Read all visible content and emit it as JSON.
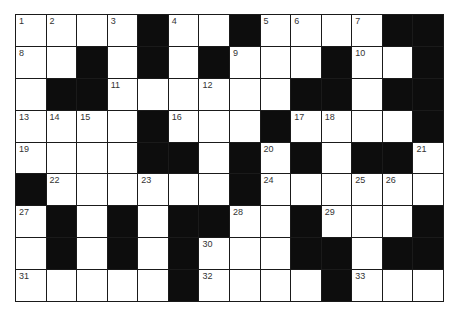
{
  "puzzle": {
    "type": "crossword",
    "rows": 9,
    "cols": 14,
    "colors": {
      "white": "#ffffff",
      "black": "#0d0d0d",
      "grid_line": "#1a1a1a",
      "number": "#333333"
    },
    "legend": "W = white cell, B = black cell, numbers = clue numbers",
    "grid": [
      [
        "1",
        "2",
        "W",
        "3",
        "B",
        "4",
        "W",
        "B",
        "5",
        "6",
        "W",
        "7",
        "B",
        "B"
      ],
      [
        "8",
        "W",
        "B",
        "W",
        "B",
        "W",
        "B",
        "9",
        "W",
        "W",
        "B",
        "10",
        "W",
        "B"
      ],
      [
        "W",
        "B",
        "B",
        "11",
        "W",
        "W",
        "12",
        "W",
        "W",
        "B",
        "B",
        "W",
        "B",
        "B"
      ],
      [
        "13",
        "14",
        "15",
        "W",
        "B",
        "16",
        "W",
        "W",
        "B",
        "17",
        "18",
        "W",
        "W",
        "B"
      ],
      [
        "19",
        "W",
        "W",
        "W",
        "B",
        "B",
        "W",
        "B",
        "20",
        "B",
        "W",
        "B",
        "B",
        "21"
      ],
      [
        "B",
        "22",
        "W",
        "W",
        "23",
        "W",
        "W",
        "B",
        "24",
        "W",
        "W",
        "25",
        "26",
        "W"
      ],
      [
        "27",
        "B",
        "W",
        "B",
        "W",
        "B",
        "B",
        "28",
        "W",
        "B",
        "29",
        "W",
        "W",
        "B"
      ],
      [
        "W",
        "B",
        "W",
        "B",
        "W",
        "B",
        "30",
        "W",
        "W",
        "B",
        "B",
        "W",
        "B",
        "B"
      ],
      [
        "31",
        "W",
        "W",
        "W",
        "W",
        "B",
        "32",
        "W",
        "W",
        "W",
        "B",
        "33",
        "W",
        "W"
      ]
    ],
    "clue_numbers": [
      "1",
      "2",
      "3",
      "4",
      "5",
      "6",
      "7",
      "8",
      "9",
      "10",
      "11",
      "12",
      "13",
      "14",
      "15",
      "16",
      "17",
      "18",
      "19",
      "20",
      "21",
      "22",
      "23",
      "24",
      "25",
      "26",
      "27",
      "28",
      "29",
      "30",
      "31",
      "32",
      "33"
    ]
  }
}
